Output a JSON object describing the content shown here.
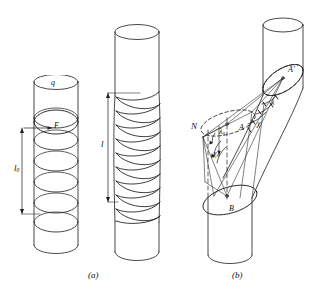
{
  "figure": {
    "background_color": "#ffffff",
    "line_color": "#1a1a1a",
    "label_color": "#111111",
    "width": 327,
    "height": 296
  },
  "captions": [
    {
      "id": "cap-a",
      "text": "(a)",
      "x": 88,
      "y": 272
    },
    {
      "id": "cap-b",
      "text": "(b)",
      "x": 232,
      "y": 272
    }
  ],
  "panel_a": {
    "name": "untwisted-and-twisted-cylinders",
    "left_cylinder": {
      "name": "untwisted-cylinder",
      "labels": [
        {
          "id": "label-q",
          "text": "q",
          "base": "q",
          "sub": "",
          "x": 51,
          "y": 83,
          "size": 8
        },
        {
          "id": "label-F",
          "text": "F",
          "base": "F",
          "sub": "",
          "x": 54,
          "y": 125,
          "size": 8
        },
        {
          "id": "label-l0",
          "text": "l0",
          "base": "l",
          "sub": "0",
          "x": 18,
          "y": 168,
          "size": 9
        }
      ],
      "dimension": {
        "name": "l0-dimension-bar",
        "label": "l0"
      }
    },
    "right_cylinder": {
      "name": "twisted-cylinder",
      "labels": [
        {
          "id": "label-l",
          "text": "l",
          "base": "l",
          "sub": "",
          "x": 101,
          "y": 140,
          "size": 9
        }
      ],
      "dimension": {
        "name": "l-dimension-bar",
        "label": "l"
      }
    }
  },
  "panel_b": {
    "name": "kinked-cylinder-angle-construction",
    "labels": [
      {
        "id": "label-A-prime",
        "text": "A′",
        "base": "A",
        "sub": "",
        "prime": true,
        "x": 291,
        "y": 71,
        "size": 8
      },
      {
        "id": "label-N",
        "text": "N",
        "base": "N",
        "sub": "",
        "prime": false,
        "x": 196,
        "y": 128,
        "size": 9
      },
      {
        "id": "label-A",
        "text": "A",
        "base": "A",
        "sub": "",
        "prime": false,
        "x": 240,
        "y": 128,
        "size": 8
      },
      {
        "id": "label-lambda0",
        "text": "λ0",
        "base": "λ",
        "sub": "0",
        "prime": false,
        "x": 222,
        "y": 132,
        "size": 8
      },
      {
        "id": "label-chi0",
        "text": "χ0",
        "base": "χ",
        "sub": "0",
        "prime": false,
        "x": 216,
        "y": 154,
        "size": 8
      },
      {
        "id": "label-lambda",
        "text": "λ",
        "base": "λ",
        "sub": "",
        "prime": false,
        "x": 272,
        "y": 103,
        "size": 8
      },
      {
        "id": "label-chi",
        "text": "χ",
        "base": "χ",
        "sub": "",
        "prime": false,
        "x": 258,
        "y": 124,
        "size": 8
      },
      {
        "id": "label-B",
        "text": "B",
        "base": "B",
        "sub": "",
        "prime": false,
        "x": 231,
        "y": 209,
        "size": 8
      }
    ],
    "points": [
      {
        "id": "point-A-prime",
        "name": "vertex-A-prime",
        "x": 283,
        "y": 78
      },
      {
        "id": "point-A",
        "name": "vertex-A",
        "x": 227,
        "y": 124
      },
      {
        "id": "point-B",
        "name": "vertex-B",
        "x": 227,
        "y": 201
      },
      {
        "id": "point-N",
        "name": "vertex-N",
        "x": 203,
        "y": 137
      }
    ]
  }
}
